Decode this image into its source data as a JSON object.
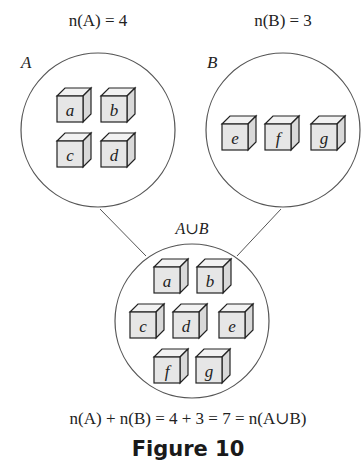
{
  "labels": {
    "nA": "n(A) = 4",
    "nB": "n(B) = 3",
    "setA": "A",
    "setB": "B",
    "union": "A∪B",
    "equation": "n(A) + n(B) = 4 + 3 = 7 = n(A∪B)",
    "caption": "Figure 10"
  },
  "sets": {
    "A": {
      "elements": [
        "a",
        "b",
        "c",
        "d"
      ],
      "count": 4
    },
    "B": {
      "elements": [
        "e",
        "f",
        "g"
      ],
      "count": 3
    },
    "union": {
      "elements": [
        "a",
        "b",
        "c",
        "d",
        "e",
        "f",
        "g"
      ],
      "count": 7
    }
  },
  "colors": {
    "stroke": "#555555",
    "cube_face": "#e6e6e6",
    "cube_top": "#f2f2f2",
    "cube_side": "#d9d9d9",
    "cube_edge": "#222222"
  }
}
